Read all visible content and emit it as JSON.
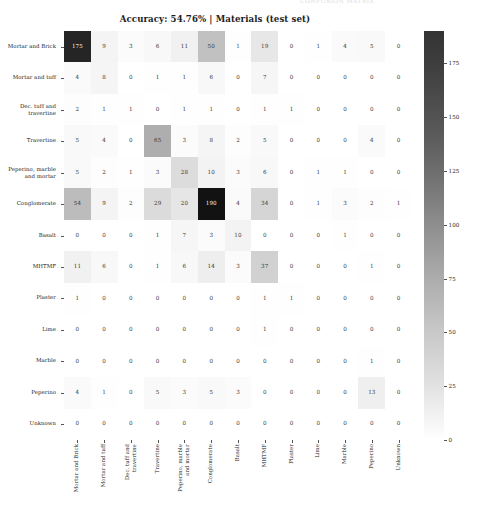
{
  "top_clip_text": "CONFUSION MATRIX",
  "chart_data": {
    "type": "heatmap",
    "title": "Accuracy: 54.76%  |  Materials (test set)",
    "title_main": "Accuracy: 54.76%  |  Materials",
    "title_sub": "(test set)",
    "accuracy": "54.76%",
    "dataset": "Materials (test set)",
    "xlabel": "",
    "ylabel": "",
    "grid": false,
    "colormap": "Greys",
    "colorbar": {
      "ticks": [
        0,
        25,
        50,
        75,
        100,
        125,
        150,
        175
      ],
      "tick_labels": [
        "0",
        "25",
        "50",
        "75",
        "100",
        "125",
        "150",
        "175"
      ],
      "vmin": 0,
      "vmax": 190,
      "position": "right"
    },
    "categories": [
      "Mortar and Brick",
      "Mortar and tuff",
      "Dec. tuff and\ntravertine",
      "Travertine",
      "Peperino, marble\nand mortar",
      "Conglomerate",
      "Basalt",
      "MHTMF",
      "Plaster",
      "Lime",
      "Marble",
      "Peperino",
      "Unknown"
    ],
    "row_labels": [
      "Mortar and Brick",
      "Mortar and tuff",
      "Dec. tuff and\ntravertine",
      "Travertine",
      "Peperino, marble\nand mortar",
      "Conglomerate",
      "Basalt",
      "MHTMF",
      "Plaster",
      "Lime",
      "Marble",
      "Peperino",
      "Unknown"
    ],
    "column_labels": [
      "Mortar and Brick",
      "Mortar and tuff",
      "Dec. tuff and\ntravertine",
      "Travertine",
      "Peperino, marble\nand mortar",
      "Conglomerate",
      "Basalt",
      "MHTMF",
      "Plaster",
      "Lime",
      "Marble",
      "Peperino",
      "Unknown"
    ],
    "values": [
      [
        175,
        9,
        3,
        6,
        11,
        50,
        1,
        19,
        0,
        1,
        4,
        5,
        0
      ],
      [
        4,
        8,
        0,
        1,
        1,
        6,
        0,
        7,
        0,
        0,
        0,
        0,
        0
      ],
      [
        2,
        1,
        1,
        0,
        1,
        1,
        0,
        1,
        1,
        0,
        0,
        0,
        0
      ],
      [
        5,
        4,
        0,
        65,
        3,
        8,
        2,
        5,
        0,
        0,
        0,
        4,
        0
      ],
      [
        5,
        2,
        1,
        3,
        28,
        10,
        3,
        6,
        0,
        1,
        1,
        0,
        0
      ],
      [
        54,
        9,
        2,
        29,
        20,
        190,
        4,
        34,
        0,
        1,
        3,
        2,
        1
      ],
      [
        0,
        0,
        0,
        1,
        7,
        3,
        10,
        0,
        0,
        0,
        1,
        0,
        0
      ],
      [
        11,
        6,
        0,
        1,
        6,
        14,
        3,
        37,
        0,
        0,
        0,
        1,
        0
      ],
      [
        1,
        0,
        0,
        0,
        0,
        0,
        0,
        1,
        1,
        0,
        0,
        0,
        0
      ],
      [
        0,
        0,
        0,
        0,
        0,
        0,
        0,
        1,
        0,
        0,
        0,
        0,
        0
      ],
      [
        0,
        0,
        0,
        0,
        0,
        0,
        0,
        0,
        0,
        0,
        0,
        1,
        0
      ],
      [
        4,
        1,
        0,
        5,
        3,
        5,
        3,
        0,
        0,
        0,
        0,
        13,
        0
      ],
      [
        0,
        0,
        0,
        0,
        0,
        0,
        0,
        0,
        0,
        0,
        0,
        0,
        0
      ]
    ]
  }
}
